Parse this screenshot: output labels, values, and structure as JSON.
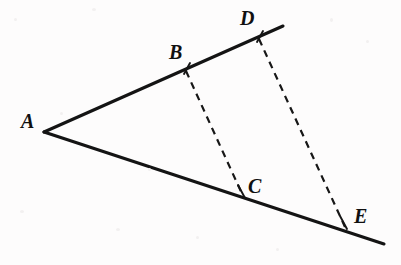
{
  "figure": {
    "background_color": "#fdfcfc",
    "line_color": "#141414",
    "labels": {
      "a": "A",
      "b": "B",
      "c": "C",
      "d": "D",
      "e": "E"
    },
    "points": {
      "A": {
        "x": 44,
        "y": 132
      },
      "B": {
        "x": 186,
        "y": 71
      },
      "C": {
        "x": 243,
        "y": 196
      },
      "D": {
        "x": 259,
        "y": 39
      },
      "E": {
        "x": 345,
        "y": 227
      }
    },
    "label_positions": {
      "A": {
        "x": 21,
        "y": 111
      },
      "B": {
        "x": 169,
        "y": 42
      },
      "C": {
        "x": 248,
        "y": 176
      },
      "D": {
        "x": 240,
        "y": 8
      },
      "E": {
        "x": 354,
        "y": 206
      }
    },
    "segments": [
      {
        "name": "upper-ray",
        "style": "solid",
        "from": "A",
        "to": "ray-end-upper"
      },
      {
        "name": "lower-ray",
        "style": "solid",
        "from": "A",
        "to": "ray-end-lower"
      },
      {
        "name": "segment-bc",
        "style": "dashed",
        "from": "B",
        "to": "C"
      },
      {
        "name": "segment-de",
        "style": "dashed",
        "from": "D",
        "to": "E"
      }
    ],
    "ray_endpoints": {
      "upper": {
        "x": 283,
        "y": 26
      },
      "lower": {
        "x": 384,
        "y": 244
      }
    }
  }
}
